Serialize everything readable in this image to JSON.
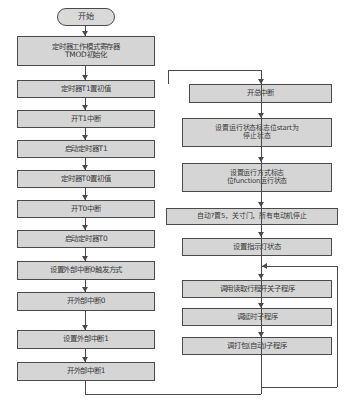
{
  "diagram": {
    "orientation": "two-column top-down flowchart",
    "colors": {
      "node_fill": "#d5d5d5",
      "node_border": "#4a4a4a",
      "connector": "#4a4a4a",
      "background": "#ffffff",
      "text": "#3a3a3a"
    },
    "left_column": {
      "nodes": [
        {
          "id": "start",
          "shape": "terminator",
          "label": "开始"
        },
        {
          "id": "l1",
          "shape": "process",
          "label": "定时器工作模式寄存器\nTMOD初始化"
        },
        {
          "id": "l2",
          "shape": "process",
          "label": "定时器T1置初值"
        },
        {
          "id": "l3",
          "shape": "process",
          "label": "开T1中断"
        },
        {
          "id": "l4",
          "shape": "process",
          "label": "启动定时器T1"
        },
        {
          "id": "l5",
          "shape": "process",
          "label": "定时器T0置初值"
        },
        {
          "id": "l6",
          "shape": "process",
          "label": "开T0中断"
        },
        {
          "id": "l7",
          "shape": "process",
          "label": "启动定时器T0"
        },
        {
          "id": "l8",
          "shape": "process",
          "label": "设置外部中断0触发方式"
        },
        {
          "id": "l9",
          "shape": "process",
          "label": "开外部中断0"
        },
        {
          "id": "l10",
          "shape": "process",
          "label": "设置外部中断1"
        },
        {
          "id": "l11",
          "shape": "process",
          "label": "开外部中断1"
        }
      ]
    },
    "right_column": {
      "nodes": [
        {
          "id": "r1",
          "shape": "process",
          "label": "开总中断"
        },
        {
          "id": "r2",
          "shape": "process",
          "label": "设置运行状态标志位start为\n停止状态"
        },
        {
          "id": "r3",
          "shape": "process",
          "label": "设置运行方式标志\n位function运行状态"
        },
        {
          "id": "r4",
          "shape": "process",
          "label": "自动?置5，关寸门，所有电动机停止"
        },
        {
          "id": "r5",
          "shape": "process",
          "label": "设置指示灯状态"
        },
        {
          "id": "r6",
          "shape": "process",
          "label": "调用读取行程开关子程序"
        },
        {
          "id": "r7",
          "shape": "process",
          "label": "调延时子程序"
        },
        {
          "id": "r8",
          "shape": "process",
          "label": "调打包(自动)子程序"
        }
      ]
    },
    "connectors": {
      "left_to_right_label": "",
      "loop_back_label": ""
    }
  }
}
